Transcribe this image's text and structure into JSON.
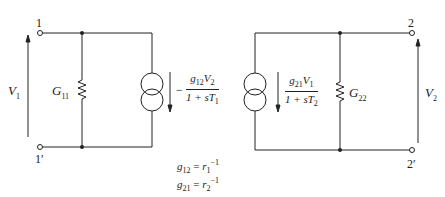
{
  "diagram": {
    "caption_partial": "",
    "port1": {
      "terminal_top": "1",
      "terminal_bottom": "1′",
      "voltage": "V",
      "voltage_sub": "1",
      "conductance": "G",
      "conductance_sub": "11",
      "source": {
        "sign": "−",
        "num_g": "g",
        "num_g_sub": "12",
        "num_v": "V",
        "num_v_sub": "2",
        "den_prefix": "1 + s",
        "den_T": "T",
        "den_T_sub": "1"
      }
    },
    "port2": {
      "terminal_top": "2",
      "terminal_bottom": "2′",
      "voltage": "V",
      "voltage_sub": "2",
      "conductance": "G",
      "conductance_sub": "22",
      "source": {
        "num_g": "g",
        "num_g_sub": "21",
        "num_v": "V",
        "num_v_sub": "1",
        "den_prefix": "1 + s",
        "den_T": "T",
        "den_T_sub": "2"
      }
    },
    "equations": [
      {
        "lhs": "g",
        "lhs_sub": "12",
        "eq": " = ",
        "rhs": "r",
        "rhs_sub": "1",
        "rhs_sup": "−1"
      },
      {
        "lhs": "g",
        "lhs_sub": "21",
        "eq": " = ",
        "rhs": "r",
        "rhs_sub": "2",
        "rhs_sup": "−1"
      }
    ]
  }
}
